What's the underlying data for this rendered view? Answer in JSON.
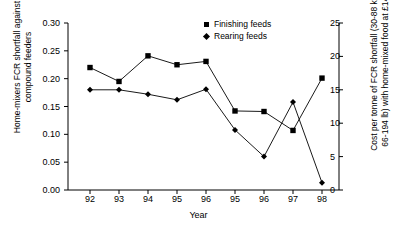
{
  "chart_data": {
    "type": "line",
    "title": "",
    "xlabel": "Year",
    "ylabel": "Home-mixers FCR shortfall against compound feeders",
    "ylabel_right": "Cost per tonne of FCR shortfall (30-88 kg/ or 66-194 lb) with home-mixed food at £145/t",
    "categories": [
      "92",
      "93",
      "94",
      "95",
      "96",
      "95",
      "96",
      "97",
      "98"
    ],
    "ylim": [
      0.0,
      0.3
    ],
    "yticks": [
      "0.00",
      "0.05",
      "0.10",
      "0.15",
      "0.20",
      "0.25",
      "0.30"
    ],
    "ylim_right": [
      0,
      25
    ],
    "yticks_right": [
      "0",
      "5",
      "10",
      "15",
      "20",
      "25"
    ],
    "grid": false,
    "legend_position": "top-center-right",
    "series": [
      {
        "name": "Finishing feeds",
        "marker": "square",
        "color": "#000000",
        "values": [
          0.22,
          0.195,
          0.241,
          0.225,
          0.231,
          0.142,
          0.141,
          0.107,
          0.201
        ]
      },
      {
        "name": "Rearing feeds",
        "marker": "diamond",
        "color": "#000000",
        "values": [
          0.18,
          0.18,
          0.172,
          0.162,
          0.181,
          0.108,
          0.06,
          0.158,
          0.013
        ]
      }
    ]
  },
  "legend": {
    "items": [
      {
        "label": "Finishing feeds",
        "marker": "square-marker"
      },
      {
        "label": "Rearing feeds",
        "marker": "diamond-marker"
      }
    ]
  },
  "axes": {
    "x_title": "Year",
    "y_left_title": "Home-mixers FCR shortfall against compound feeders",
    "y_right_title": "Cost per tonne of FCR shortfall (30-88 kg/ or 66-194 lb) with home-mixed food at £145/t"
  }
}
